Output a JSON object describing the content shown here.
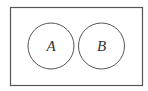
{
  "diagram": {
    "type": "venn",
    "universal_set": {
      "x": 10,
      "y": 7,
      "width": 133,
      "height": 79,
      "stroke": "#555555"
    },
    "sets": [
      {
        "label": "A",
        "cx": 51,
        "cy": 46,
        "r": 23,
        "stroke": "#555555"
      },
      {
        "label": "B",
        "cx": 101.5,
        "cy": 46,
        "r": 23,
        "stroke": "#555555"
      }
    ],
    "relation": "disjoint"
  }
}
